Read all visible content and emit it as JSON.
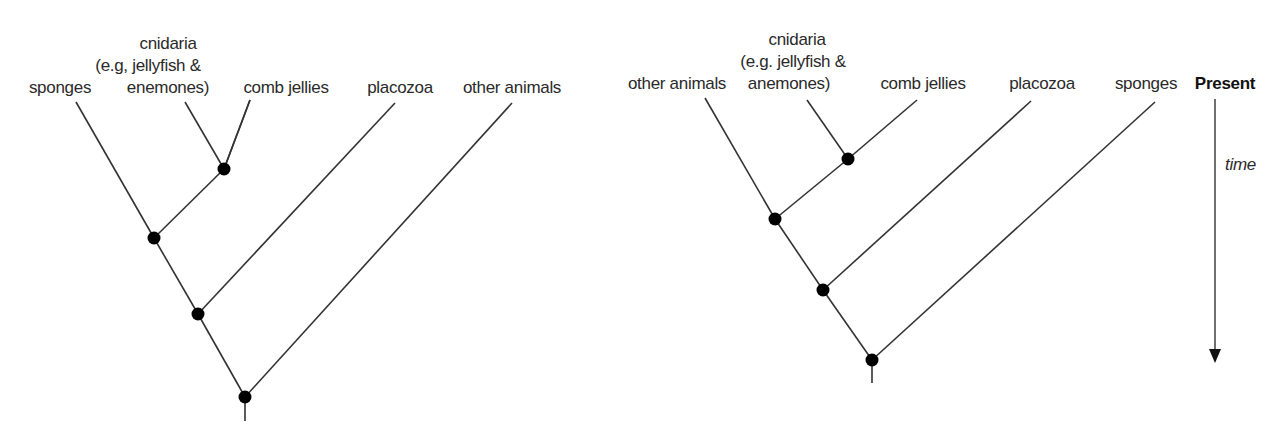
{
  "left_tree": {
    "labels": {
      "sponges": "sponges",
      "cnidaria_1": "cnidaria",
      "cnidaria_2": "(e.g, jellyfish &",
      "cnidaria_3": "enemones)",
      "comb_jellies": "comb jellies",
      "placozoa": "placozoa",
      "other_animals": "other animals"
    },
    "tips_order": [
      "sponges",
      "cnidaria (e.g, jellyfish & enemones)",
      "comb jellies",
      "placozoa",
      "other animals"
    ],
    "topology": "((((cnidaria, comb jellies), sponges), placozoa), other animals)",
    "node_count": 4
  },
  "right_tree": {
    "labels": {
      "other_animals": "other animals",
      "cnidaria_1": "cnidaria",
      "cnidaria_2": "(e.g. jellyfish &",
      "cnidaria_3": "anemones)",
      "comb_jellies": "comb jellies",
      "placozoa": "placozoa",
      "sponges": "sponges"
    },
    "tips_order": [
      "other animals",
      "cnidaria (e.g. jellyfish & anemones)",
      "comb jellies",
      "placozoa",
      "sponges"
    ],
    "topology": "((((cnidaria, comb jellies), other animals), placozoa), sponges)",
    "node_count": 4
  },
  "time_axis": {
    "top_label": "Present",
    "axis_label": "time",
    "direction": "down"
  },
  "colors": {
    "line": "#333333",
    "node": "#000000",
    "text": "#2a2a2a"
  }
}
